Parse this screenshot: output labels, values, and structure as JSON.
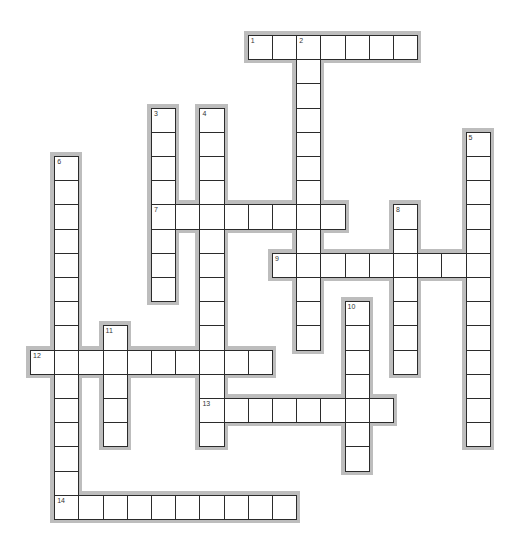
{
  "puzzle": {
    "type": "crossword",
    "grid": {
      "origin_x": 30,
      "origin_y": 35,
      "cell_size": 24.2
    },
    "colors": {
      "cell_border": "#2b2b2b",
      "cell_bg": "#ffffff",
      "shadow": "#bdbdbd",
      "number": "#333333"
    },
    "words": [
      {
        "number": "1",
        "direction": "across",
        "row": 0,
        "col": 9,
        "length": 7
      },
      {
        "number": "2",
        "direction": "down",
        "row": 0,
        "col": 11,
        "length": 13
      },
      {
        "number": "3",
        "direction": "down",
        "row": 3,
        "col": 5,
        "length": 8
      },
      {
        "number": "4",
        "direction": "down",
        "row": 3,
        "col": 7,
        "length": 14
      },
      {
        "number": "5",
        "direction": "down",
        "row": 4,
        "col": 18,
        "length": 13
      },
      {
        "number": "6",
        "direction": "down",
        "row": 5,
        "col": 1,
        "length": 15
      },
      {
        "number": "7",
        "direction": "across",
        "row": 7,
        "col": 5,
        "length": 8
      },
      {
        "number": "8",
        "direction": "down",
        "row": 7,
        "col": 15,
        "length": 7
      },
      {
        "number": "9",
        "direction": "across",
        "row": 9,
        "col": 10,
        "length": 9
      },
      {
        "number": "10",
        "direction": "down",
        "row": 11,
        "col": 13,
        "length": 7
      },
      {
        "number": "11",
        "direction": "down",
        "row": 12,
        "col": 3,
        "length": 5
      },
      {
        "number": "12",
        "direction": "across",
        "row": 13,
        "col": 0,
        "length": 10
      },
      {
        "number": "13",
        "direction": "across",
        "row": 15,
        "col": 7,
        "length": 8
      },
      {
        "number": "14",
        "direction": "across",
        "row": 19,
        "col": 1,
        "length": 10
      }
    ]
  }
}
